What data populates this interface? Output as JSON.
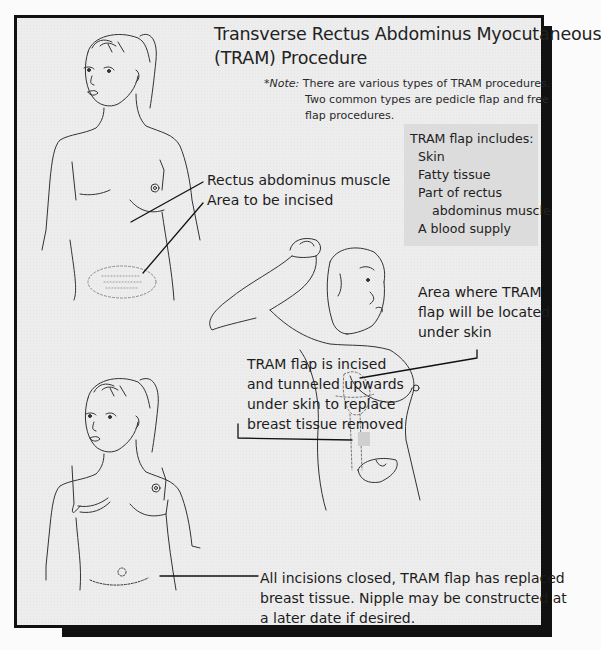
{
  "title": {
    "line1": "Transverse Rectus Abdominus Myocutaneous",
    "line2": "(TRAM) Procedure"
  },
  "note": {
    "label": "*Note:",
    "line1": "There are various types of TRAM procedures.",
    "line2": "Two common types are pedicle flap and free",
    "line3": "flap procedures."
  },
  "includes": {
    "heading": "TRAM flap includes:",
    "items": [
      "Skin",
      "Fatty tissue",
      "Part of rectus",
      "abdominus muscle",
      "A blood supply"
    ]
  },
  "labels": {
    "rectus": "Rectus abdominus muscle",
    "incise": "Area to be incised",
    "area_line1": "Area where TRAM",
    "area_line2": "flap will be located",
    "area_line3": "under skin",
    "flap_line1": "TRAM flap is incised",
    "flap_line2": "and tunneled upwards",
    "flap_line3": "under skin to replace",
    "flap_line4": "breast tissue removed",
    "closed_line1": "All incisions closed, TRAM flap has replaced",
    "closed_line2": "breast tissue. Nipple may be constructed at",
    "closed_line3": "a later date if desired."
  },
  "figures": [
    {
      "name": "figure-before",
      "description": "front view, abdomen incision area marked"
    },
    {
      "name": "figure-during",
      "description": "arm raised, flap tunneled to chest"
    },
    {
      "name": "figure-after",
      "description": "front view, incisions closed"
    }
  ],
  "colors": {
    "frame": "#111111",
    "background": "#ededed",
    "include_box": "#dcdcdc",
    "ink": "#1c1c1c"
  }
}
